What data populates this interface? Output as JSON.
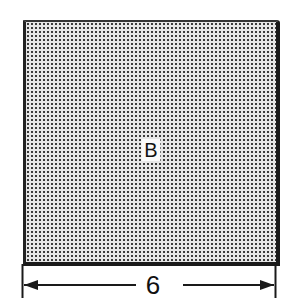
{
  "figure": {
    "shape_label": "B",
    "shape_fill": "stippled gray",
    "dimension": {
      "label": "6",
      "direction": "horizontal",
      "arrowheads": "both ends"
    },
    "colors": {
      "outline": "#1a1a1a",
      "fill_dots": "#3a3a3a",
      "background": "#ffffff"
    }
  }
}
